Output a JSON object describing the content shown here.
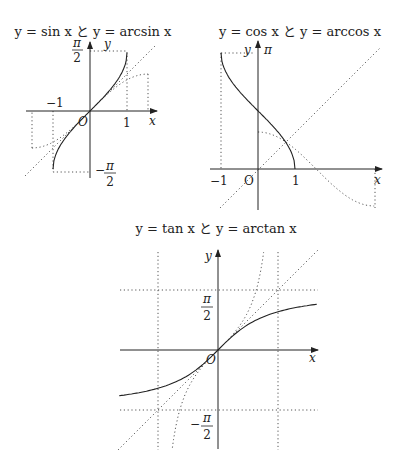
{
  "chart_data": [
    {
      "type": "line",
      "title": "y = sin x と y = arcsin x",
      "xlabel": "x",
      "ylabel": "y",
      "origin_label": "O",
      "tick_labels": {
        "x": [
          "−1",
          "1"
        ],
        "y_top": "π/2",
        "y_bottom": "−π/2"
      },
      "xlim": [
        -1.75,
        1.75
      ],
      "ylim": [
        -1.75,
        1.75
      ],
      "series": [
        {
          "name": "arcsin x",
          "style": "solid",
          "domain": [
            -1,
            1
          ]
        },
        {
          "name": "sin x",
          "style": "dotted",
          "domain": [
            -1.5708,
            1.5708
          ]
        },
        {
          "name": "y = x",
          "style": "dotted",
          "domain": [
            -1.75,
            1.75
          ]
        }
      ]
    },
    {
      "type": "line",
      "title": "y = cos x と y = arccos x",
      "xlabel": "x",
      "ylabel": "y",
      "origin_label": "O",
      "tick_labels": {
        "x": [
          "−1",
          "1"
        ],
        "y_top": "π"
      },
      "xlim": [
        -1.2,
        3.3
      ],
      "ylim": [
        -1.1,
        3.3
      ],
      "series": [
        {
          "name": "arccos x",
          "style": "solid",
          "domain": [
            -1,
            1
          ]
        },
        {
          "name": "cos x",
          "style": "dotted",
          "domain": [
            0,
            3.1416
          ]
        },
        {
          "name": "y = x",
          "style": "dotted",
          "domain": [
            -1.2,
            3.2
          ]
        }
      ]
    },
    {
      "type": "line",
      "title": "y = tan x と y = arctan x",
      "xlabel": "x",
      "ylabel": "y",
      "origin_label": "O",
      "tick_labels": {
        "y_top": "π/2",
        "y_bottom": "−π/2"
      },
      "xlim": [
        -2.6,
        2.6
      ],
      "ylim": [
        -2.6,
        2.6
      ],
      "series": [
        {
          "name": "arctan x",
          "style": "solid",
          "domain": [
            -2.6,
            2.6
          ]
        },
        {
          "name": "tan x",
          "style": "dotted",
          "domain": [
            -1.2,
            1.2
          ]
        },
        {
          "name": "y = x",
          "style": "dotted",
          "domain": [
            -2.6,
            2.6
          ]
        },
        {
          "name": "asymptotes x = ±π/2, y = ±π/2",
          "style": "dotted"
        }
      ]
    }
  ],
  "graphs": {
    "g1": {
      "title": "y = sin x と y = arcsin x",
      "x": "x",
      "y": "y",
      "o": "O",
      "neg1": "−1",
      "one": "1",
      "pi": "π",
      "two": "2",
      "minus": "−"
    },
    "g2": {
      "title": "y = cos x と y = arccos x",
      "x": "x",
      "y": "y",
      "o": "O",
      "neg1": "−1",
      "one": "1",
      "pi": "π"
    },
    "g3": {
      "title": "y = tan x と y = arctan x",
      "x": "x",
      "y": "y",
      "o": "O",
      "pi": "π",
      "two": "2",
      "minus": "−"
    }
  }
}
